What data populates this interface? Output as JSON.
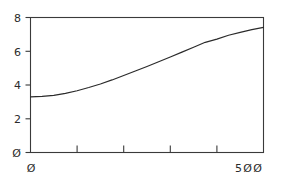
{
  "chart_data": {
    "type": "line",
    "title": "",
    "subtitle": "",
    "xlabel": "",
    "ylabel": "",
    "xlim": [
      0,
      500
    ],
    "ylim": [
      0,
      8
    ],
    "grid": false,
    "legend": null,
    "frame": "full-box",
    "line_color": "#2b2b2b",
    "axis_color": "#3a3a3a",
    "background_color": "#ffffff",
    "x_ticks": [
      0,
      100,
      200,
      300,
      400,
      500
    ],
    "x_tick_labels": [
      "Ø",
      "",
      "",
      "",
      "",
      "5ØØ"
    ],
    "y_ticks": [
      0,
      2,
      4,
      6,
      8
    ],
    "y_tick_labels": [
      "Ø",
      "2",
      "4",
      "6",
      "8"
    ],
    "series": [
      {
        "name": "curve",
        "x": [
          0,
          25,
          50,
          75,
          100,
          125,
          150,
          175,
          200,
          225,
          250,
          275,
          300,
          325,
          350,
          375,
          400,
          425,
          450,
          475,
          500
        ],
        "values": [
          3.3,
          3.32,
          3.38,
          3.5,
          3.66,
          3.85,
          4.06,
          4.3,
          4.56,
          4.83,
          5.1,
          5.38,
          5.66,
          5.95,
          6.24,
          6.53,
          6.72,
          6.95,
          7.12,
          7.28,
          7.42
        ]
      }
    ]
  },
  "axis_labels": {
    "y_top": "8",
    "y_6": "6",
    "y_4": "4",
    "y_2": "2",
    "y_zero": "Ø",
    "x_zero": "Ø",
    "x_max": "5ØØ"
  }
}
